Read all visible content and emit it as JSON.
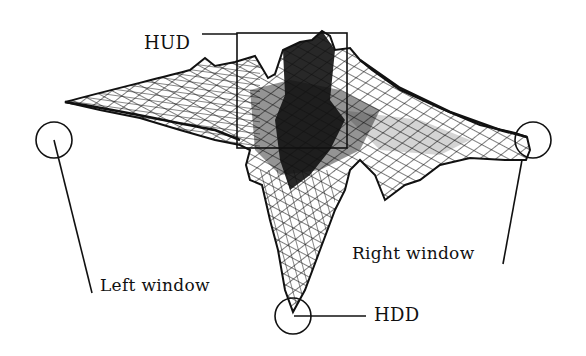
{
  "figure": {
    "type": "wireframe-surface",
    "colors": {
      "ink": "#111111",
      "background": "#ffffff"
    }
  },
  "annotations": {
    "hud": {
      "label": "HUD",
      "marker": "rectangle"
    },
    "left_window": {
      "label": "Left window",
      "marker": "circle"
    },
    "right_window": {
      "label": "Right window",
      "marker": "circle"
    },
    "hdd": {
      "label": "HDD",
      "marker": "circle"
    }
  }
}
